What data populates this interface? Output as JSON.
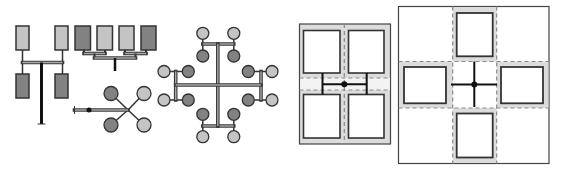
{
  "canvas": {
    "width": 562,
    "height": 173,
    "background": "#ffffff"
  },
  "colors": {
    "light": "#c4c4c4",
    "dark": "#828282",
    "outline": "#333333",
    "bar_outline": "#3a3a3a",
    "bar_inner": "#a8a8a8",
    "ring": "#dcdcdc",
    "corridor": "#f3f3f3",
    "dash": "#8a8a8a",
    "wall": "#444444",
    "room_fill": "#ffffff",
    "link": "#111111"
  },
  "diagrams": [
    {
      "name": "h-tree-pairs-diagram",
      "elements": [
        {
          "type": "line",
          "name": "connector",
          "x1": 22.5,
          "y1": 50,
          "x2": 22.5,
          "y2": 74,
          "w": 1.5
        },
        {
          "type": "line",
          "name": "connector",
          "x1": 62.5,
          "y1": 50,
          "x2": 62.5,
          "y2": 74,
          "w": 1.5
        },
        {
          "type": "bar",
          "name": "trunk-bar",
          "x1": 22.5,
          "y1": 62.5,
          "x2": 62.5,
          "y2": 62.5
        },
        {
          "type": "line",
          "name": "main-stem",
          "x1": 41.5,
          "y1": 62.5,
          "x2": 41.5,
          "y2": 124,
          "w": 3,
          "color": "link"
        },
        {
          "type": "line",
          "name": "stem-foot",
          "x1": 37.5,
          "y1": 124,
          "x2": 45.5,
          "y2": 124,
          "w": 1
        },
        {
          "type": "rect",
          "name": "unit-light",
          "x": 16,
          "y": 26,
          "w": 13,
          "h": 24,
          "fill": "light"
        },
        {
          "type": "rect",
          "name": "unit-light",
          "x": 55,
          "y": 26,
          "w": 13,
          "h": 24,
          "fill": "light"
        },
        {
          "type": "rect",
          "name": "unit-dark",
          "x": 16,
          "y": 74,
          "w": 13,
          "h": 24,
          "fill": "dark"
        },
        {
          "type": "rect",
          "name": "unit-dark",
          "x": 55,
          "y": 74,
          "w": 13,
          "h": 24,
          "fill": "dark"
        }
      ]
    },
    {
      "name": "comb-tree-diagram",
      "elements": [
        {
          "type": "line",
          "name": "connector",
          "x1": 84,
          "y1": 50,
          "x2": 84,
          "y2": 53.5,
          "w": 2
        },
        {
          "type": "line",
          "name": "connector",
          "x1": 105,
          "y1": 50,
          "x2": 105,
          "y2": 53.5,
          "w": 2
        },
        {
          "type": "line",
          "name": "connector",
          "x1": 125,
          "y1": 50,
          "x2": 125,
          "y2": 53.5,
          "w": 2
        },
        {
          "type": "line",
          "name": "connector",
          "x1": 146,
          "y1": 50,
          "x2": 146,
          "y2": 53.5,
          "w": 2
        },
        {
          "type": "bar",
          "name": "pair-bar",
          "x1": 84,
          "y1": 53.5,
          "x2": 105,
          "y2": 53.5
        },
        {
          "type": "bar",
          "name": "pair-bar",
          "x1": 125,
          "y1": 53.5,
          "x2": 146,
          "y2": 53.5
        },
        {
          "type": "line",
          "name": "connector",
          "x1": 94.5,
          "y1": 53.5,
          "x2": 94.5,
          "y2": 58,
          "w": 2
        },
        {
          "type": "line",
          "name": "connector",
          "x1": 135.5,
          "y1": 53.5,
          "x2": 135.5,
          "y2": 58,
          "w": 2
        },
        {
          "type": "bar",
          "name": "trunk-bar",
          "x1": 94.5,
          "y1": 58,
          "x2": 135.5,
          "y2": 58
        },
        {
          "type": "line",
          "name": "main-stem",
          "x1": 115,
          "y1": 58,
          "x2": 115,
          "y2": 71,
          "w": 2.5,
          "color": "link"
        },
        {
          "type": "rect",
          "name": "unit-dark",
          "x": 75,
          "y": 26,
          "w": 15.5,
          "h": 24,
          "fill": "dark"
        },
        {
          "type": "rect",
          "name": "unit-light",
          "x": 97,
          "y": 26,
          "w": 15.5,
          "h": 24,
          "fill": "light"
        },
        {
          "type": "rect",
          "name": "unit-light",
          "x": 119,
          "y": 26,
          "w": 15,
          "h": 24,
          "fill": "light"
        },
        {
          "type": "rect",
          "name": "unit-dark",
          "x": 141,
          "y": 26,
          "w": 15,
          "h": 24,
          "fill": "dark"
        }
      ]
    },
    {
      "name": "star-diagram",
      "elements": [
        {
          "type": "line",
          "name": "spoke",
          "x1": 128,
          "y1": 110,
          "x2": 111,
          "y2": 93.5,
          "w": 1.5
        },
        {
          "type": "line",
          "name": "spoke",
          "x1": 128,
          "y1": 110,
          "x2": 144,
          "y2": 93.5,
          "w": 1.5
        },
        {
          "type": "line",
          "name": "spoke",
          "x1": 128,
          "y1": 110,
          "x2": 111,
          "y2": 125,
          "w": 1.5
        },
        {
          "type": "line",
          "name": "spoke",
          "x1": 128,
          "y1": 110,
          "x2": 144,
          "y2": 125,
          "w": 1.5
        },
        {
          "type": "bar",
          "name": "feed-bar",
          "x1": 74.5,
          "y1": 110,
          "x2": 128,
          "y2": 110
        },
        {
          "type": "line",
          "name": "end-cap",
          "x1": 74.5,
          "y1": 106,
          "x2": 74.5,
          "y2": 114,
          "w": 1
        },
        {
          "type": "dot",
          "name": "junction-dot",
          "cx": 89,
          "cy": 110,
          "r": 2.5
        },
        {
          "type": "circle",
          "name": "node-dark",
          "cx": 111,
          "cy": 93.5,
          "r": 7,
          "fill": "dark"
        },
        {
          "type": "circle",
          "name": "node-light",
          "cx": 144,
          "cy": 93.5,
          "r": 7,
          "fill": "light"
        },
        {
          "type": "circle",
          "name": "node-dark",
          "cx": 111,
          "cy": 125,
          "r": 7,
          "fill": "dark"
        },
        {
          "type": "circle",
          "name": "node-light",
          "cx": 144,
          "cy": 125,
          "r": 7,
          "fill": "light"
        }
      ]
    },
    {
      "name": "cross-network-diagram",
      "elements": [
        {
          "type": "line",
          "name": "connector",
          "x1": 202.8,
          "y1": 33.3,
          "x2": 202.8,
          "y2": 56,
          "w": 1.5
        },
        {
          "type": "line",
          "name": "connector",
          "x1": 233.8,
          "y1": 33.3,
          "x2": 233.8,
          "y2": 56,
          "w": 1.5
        },
        {
          "type": "line",
          "name": "connector",
          "x1": 202.8,
          "y1": 114.3,
          "x2": 202.8,
          "y2": 136.7,
          "w": 1.5
        },
        {
          "type": "line",
          "name": "connector",
          "x1": 233.8,
          "y1": 114.3,
          "x2": 233.8,
          "y2": 136.7,
          "w": 1.5
        },
        {
          "type": "line",
          "name": "connector",
          "x1": 164,
          "y1": 71.5,
          "x2": 188.3,
          "y2": 71.5,
          "w": 1.5
        },
        {
          "type": "line",
          "name": "connector",
          "x1": 164,
          "y1": 100,
          "x2": 188.3,
          "y2": 100,
          "w": 1.5
        },
        {
          "type": "line",
          "name": "connector",
          "x1": 248.3,
          "y1": 71.5,
          "x2": 272,
          "y2": 71.5,
          "w": 1.5
        },
        {
          "type": "line",
          "name": "connector",
          "x1": 248.3,
          "y1": 100,
          "x2": 272,
          "y2": 100,
          "w": 1.5
        },
        {
          "type": "bar",
          "name": "top-bar",
          "x1": 202.8,
          "y1": 44,
          "x2": 233.8,
          "y2": 44
        },
        {
          "type": "bar",
          "name": "bottom-bar",
          "x1": 202.8,
          "y1": 126,
          "x2": 233.8,
          "y2": 126
        },
        {
          "type": "bar",
          "name": "left-bar",
          "x1": 175.7,
          "y1": 71.5,
          "x2": 175.7,
          "y2": 100
        },
        {
          "type": "bar",
          "name": "right-bar",
          "x1": 261,
          "y1": 71.5,
          "x2": 261,
          "y2": 100
        },
        {
          "type": "bar",
          "name": "main-vertical-bar",
          "x1": 217.8,
          "y1": 44,
          "x2": 217.8,
          "y2": 126
        },
        {
          "type": "bar",
          "name": "main-horizontal-bar",
          "x1": 175.7,
          "y1": 85,
          "x2": 261,
          "y2": 85
        },
        {
          "type": "circle",
          "name": "node-light",
          "cx": 202.8,
          "cy": 33.3,
          "r": 6,
          "fill": "light"
        },
        {
          "type": "circle",
          "name": "node-light",
          "cx": 233.8,
          "cy": 33.3,
          "r": 6,
          "fill": "light"
        },
        {
          "type": "circle",
          "name": "node-dark",
          "cx": 202.8,
          "cy": 56,
          "r": 6,
          "fill": "dark"
        },
        {
          "type": "circle",
          "name": "node-dark",
          "cx": 233.8,
          "cy": 56,
          "r": 6,
          "fill": "dark"
        },
        {
          "type": "circle",
          "name": "node-light",
          "cx": 164,
          "cy": 71.5,
          "r": 6,
          "fill": "light"
        },
        {
          "type": "circle",
          "name": "node-dark",
          "cx": 188.3,
          "cy": 71.5,
          "r": 6,
          "fill": "dark"
        },
        {
          "type": "circle",
          "name": "node-light",
          "cx": 164,
          "cy": 100,
          "r": 6,
          "fill": "light"
        },
        {
          "type": "circle",
          "name": "node-dark",
          "cx": 188.3,
          "cy": 100,
          "r": 6,
          "fill": "dark"
        },
        {
          "type": "circle",
          "name": "node-dark",
          "cx": 248.3,
          "cy": 71.5,
          "r": 6,
          "fill": "dark"
        },
        {
          "type": "circle",
          "name": "node-light",
          "cx": 272,
          "cy": 71.5,
          "r": 6,
          "fill": "light"
        },
        {
          "type": "circle",
          "name": "node-dark",
          "cx": 248.3,
          "cy": 100,
          "r": 6,
          "fill": "dark"
        },
        {
          "type": "circle",
          "name": "node-light",
          "cx": 272,
          "cy": 100,
          "r": 6,
          "fill": "light"
        },
        {
          "type": "circle",
          "name": "node-dark",
          "cx": 202.8,
          "cy": 114.3,
          "r": 6,
          "fill": "dark"
        },
        {
          "type": "circle",
          "name": "node-dark",
          "cx": 233.8,
          "cy": 114.3,
          "r": 6,
          "fill": "dark"
        },
        {
          "type": "circle",
          "name": "node-light",
          "cx": 202.8,
          "cy": 136.7,
          "r": 6,
          "fill": "light"
        },
        {
          "type": "circle",
          "name": "node-light",
          "cx": 233.8,
          "cy": 136.7,
          "r": 6,
          "fill": "light"
        }
      ]
    },
    {
      "name": "floorplan-2x2-diagram",
      "elements": [
        {
          "type": "rect",
          "name": "outer-boundary",
          "x": 299.5,
          "y": 24,
          "w": 91,
          "h": 120,
          "fill": "ring",
          "stroke": "wall",
          "sw": 1.2
        },
        {
          "type": "rect",
          "name": "corridor-band",
          "x": 300.1,
          "y": 78,
          "w": 89.8,
          "h": 12,
          "fill": "corridor",
          "stroke": "none",
          "sw": 0
        },
        {
          "type": "dashed",
          "name": "grid-line",
          "x1": 344.3,
          "y1": 24,
          "x2": 344.3,
          "y2": 144
        },
        {
          "type": "dashed",
          "name": "grid-line",
          "x1": 299.5,
          "y1": 78,
          "x2": 390.5,
          "y2": 78
        },
        {
          "type": "dashed",
          "name": "grid-line",
          "x1": 299.5,
          "y1": 90,
          "x2": 390.5,
          "y2": 90
        },
        {
          "type": "rect",
          "name": "room",
          "x": 303.5,
          "y": 30.5,
          "w": 36.5,
          "h": 42.5,
          "fill": "room_fill",
          "stroke": "outline",
          "sw": 1.6
        },
        {
          "type": "rect",
          "name": "room",
          "x": 348.5,
          "y": 30.5,
          "w": 35.5,
          "h": 42.5,
          "fill": "room_fill",
          "stroke": "outline",
          "sw": 1.6
        },
        {
          "type": "rect",
          "name": "room",
          "x": 303.5,
          "y": 94.5,
          "w": 36.5,
          "h": 43.5,
          "fill": "room_fill",
          "stroke": "outline",
          "sw": 1.6
        },
        {
          "type": "rect",
          "name": "room",
          "x": 348.5,
          "y": 94.5,
          "w": 35.5,
          "h": 43.5,
          "fill": "room_fill",
          "stroke": "outline",
          "sw": 1.6
        },
        {
          "type": "line",
          "name": "link-line",
          "x1": 322.5,
          "y1": 73,
          "x2": 322.5,
          "y2": 94.5,
          "w": 2,
          "color": "link"
        },
        {
          "type": "line",
          "name": "link-line",
          "x1": 366.7,
          "y1": 73,
          "x2": 366.7,
          "y2": 94.5,
          "w": 2,
          "color": "link"
        },
        {
          "type": "line",
          "name": "link-line",
          "x1": 322.5,
          "y1": 84.2,
          "x2": 366.7,
          "y2": 84.2,
          "w": 2,
          "color": "link"
        },
        {
          "type": "dot",
          "name": "hub-dot",
          "cx": 344.3,
          "cy": 84.2,
          "r": 3
        }
      ]
    },
    {
      "name": "floorplan-cross-diagram",
      "elements": [
        {
          "type": "rect",
          "name": "outer-boundary",
          "x": 398.5,
          "y": 6.5,
          "w": 150.5,
          "h": 157,
          "fill": "room_fill",
          "stroke": "wall",
          "sw": 1.2
        },
        {
          "type": "rect",
          "name": "band-top",
          "x": 452.7,
          "y": 7.1,
          "w": 44,
          "h": 54.4,
          "fill": "ring",
          "stroke": "none",
          "sw": 0
        },
        {
          "type": "rect",
          "name": "band-bottom",
          "x": 452.7,
          "y": 108,
          "w": 44,
          "h": 54.9,
          "fill": "ring",
          "stroke": "none",
          "sw": 0
        },
        {
          "type": "rect",
          "name": "band-left",
          "x": 399.1,
          "y": 61.5,
          "w": 53.6,
          "h": 46.5,
          "fill": "ring",
          "stroke": "none",
          "sw": 0
        },
        {
          "type": "rect",
          "name": "band-right",
          "x": 496.7,
          "y": 61.5,
          "w": 51.7,
          "h": 46.5,
          "fill": "ring",
          "stroke": "none",
          "sw": 0
        },
        {
          "type": "dashed",
          "name": "grid-line",
          "x1": 452.7,
          "y1": 6.5,
          "x2": 452.7,
          "y2": 163.5
        },
        {
          "type": "dashed",
          "name": "grid-line",
          "x1": 496.7,
          "y1": 6.5,
          "x2": 496.7,
          "y2": 163.5
        },
        {
          "type": "dashed",
          "name": "grid-line",
          "x1": 398.5,
          "y1": 61.5,
          "x2": 549,
          "y2": 61.5
        },
        {
          "type": "dashed",
          "name": "grid-line",
          "x1": 398.5,
          "y1": 108,
          "x2": 549,
          "y2": 108
        },
        {
          "type": "rect",
          "name": "room",
          "x": 456.7,
          "y": 13,
          "w": 36,
          "h": 43.3,
          "fill": "room_fill",
          "stroke": "outline",
          "sw": 1.8
        },
        {
          "type": "rect",
          "name": "room",
          "x": 404,
          "y": 67,
          "w": 42,
          "h": 36.3,
          "fill": "room_fill",
          "stroke": "outline",
          "sw": 1.8
        },
        {
          "type": "rect",
          "name": "room",
          "x": 501,
          "y": 67,
          "w": 42,
          "h": 36.3,
          "fill": "room_fill",
          "stroke": "outline",
          "sw": 1.8
        },
        {
          "type": "rect",
          "name": "room",
          "x": 456.7,
          "y": 113.5,
          "w": 36,
          "h": 44,
          "fill": "room_fill",
          "stroke": "outline",
          "sw": 1.8
        },
        {
          "type": "line",
          "name": "link-line",
          "x1": 474.3,
          "y1": 61.5,
          "x2": 474.3,
          "y2": 107,
          "w": 2,
          "color": "link"
        },
        {
          "type": "line",
          "name": "link-line",
          "x1": 451,
          "y1": 84.5,
          "x2": 497,
          "y2": 84.5,
          "w": 2,
          "color": "link"
        },
        {
          "type": "dot",
          "name": "hub-dot",
          "cx": 474.3,
          "cy": 84.5,
          "r": 3
        }
      ]
    }
  ]
}
